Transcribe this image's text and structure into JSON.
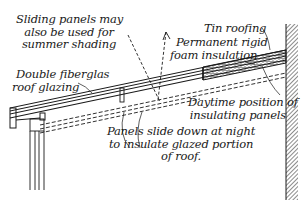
{
  "diagram": {
    "labels": {
      "sliding_panels": [
        "Sliding panels may",
        "also be used for",
        "summer shading"
      ],
      "tin_roofing": "Tin roofing",
      "foam_insulation": [
        "Permanent rigid",
        "foam insulation"
      ],
      "double_fiberglas": [
        "Double fiberglas",
        "roof glazing"
      ],
      "daytime_position": [
        "Daytime position of",
        "insulating panels"
      ],
      "panels_slide": [
        "Panels slide down at night",
        "to insulate glazed portion",
        "of roof."
      ]
    },
    "colors": {
      "ink": "#1a1a1a",
      "background": "#ffffff"
    }
  }
}
